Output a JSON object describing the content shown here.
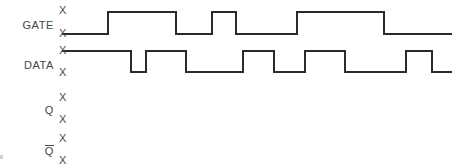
{
  "diagram": {
    "background_color": "#ffffff",
    "line_color": "#2b2b2b",
    "text_color": "#454545",
    "line_width": 1.6,
    "x_marker_glyph": "X",
    "time_axis": {
      "start_x": 62,
      "end_x": 452
    },
    "signals": [
      {
        "name": "GATE",
        "label": "GATE",
        "has_overbar": false,
        "high_y": 12,
        "low_y": 34,
        "x_marks": [
          {
            "glyph": "X",
            "x": 59,
            "y": 5
          },
          {
            "glyph": "X",
            "x": 59,
            "y": 28
          }
        ],
        "initial_level": "low",
        "transitions": [
          {
            "x": 108,
            "to": "high"
          },
          {
            "x": 176,
            "to": "low"
          },
          {
            "x": 212,
            "to": "high"
          },
          {
            "x": 236,
            "to": "low"
          },
          {
            "x": 297,
            "to": "high"
          },
          {
            "x": 384,
            "to": "low"
          }
        ]
      },
      {
        "name": "DATA",
        "label": "DATA",
        "has_overbar": false,
        "high_y": 51,
        "low_y": 72,
        "x_marks": [
          {
            "glyph": "X",
            "x": 59,
            "y": 45
          },
          {
            "glyph": "X",
            "x": 59,
            "y": 67
          }
        ],
        "initial_level": "high",
        "transitions": [
          {
            "x": 131,
            "to": "low"
          },
          {
            "x": 146,
            "to": "high"
          },
          {
            "x": 186,
            "to": "low"
          },
          {
            "x": 243,
            "to": "high"
          },
          {
            "x": 274,
            "to": "low"
          },
          {
            "x": 305,
            "to": "high"
          },
          {
            "x": 345,
            "to": "low"
          },
          {
            "x": 406,
            "to": "high"
          },
          {
            "x": 432,
            "to": "low"
          }
        ]
      },
      {
        "name": "Q",
        "label": "Q",
        "has_overbar": false,
        "high_y": 98,
        "low_y": 119,
        "x_marks": [
          {
            "glyph": "X",
            "x": 59,
            "y": 92
          },
          {
            "glyph": "X",
            "x": 59,
            "y": 114
          }
        ],
        "initial_level": "none",
        "transitions": []
      },
      {
        "name": "Qbar",
        "label": "Q",
        "has_overbar": true,
        "high_y": 139,
        "low_y": 160,
        "x_marks": [
          {
            "glyph": "X",
            "x": 59,
            "y": 133
          },
          {
            "glyph": "X",
            "x": 59,
            "y": 155
          }
        ],
        "initial_level": "none",
        "transitions": []
      }
    ]
  }
}
